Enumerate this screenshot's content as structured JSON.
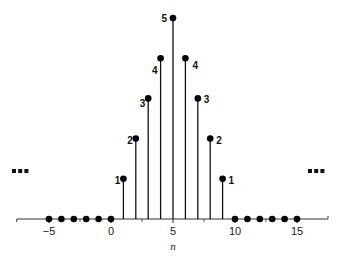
{
  "chart_data": {
    "type": "stem",
    "title": "",
    "xlabel": "n",
    "ylabel": "",
    "x": [
      -5,
      -4,
      -3,
      -2,
      -1,
      0,
      1,
      2,
      3,
      4,
      5,
      6,
      7,
      8,
      9,
      10,
      11,
      12,
      13,
      14,
      15
    ],
    "values": [
      0,
      0,
      0,
      0,
      0,
      0,
      1,
      2,
      3,
      4,
      5,
      4,
      3,
      2,
      1,
      0,
      0,
      0,
      0,
      0,
      0
    ],
    "xticks": [
      -5,
      0,
      5,
      10,
      15
    ],
    "xtick_labels": [
      "−5",
      "0",
      "5",
      "10",
      "15"
    ],
    "xlim": [
      -7.6,
      17.5
    ],
    "ylim": [
      0,
      5
    ],
    "grid": false,
    "legend": null,
    "annotations": [
      {
        "n": 1,
        "text": "1",
        "side": "left"
      },
      {
        "n": 2,
        "text": "2",
        "side": "left"
      },
      {
        "n": 3,
        "text": "3",
        "side": "left"
      },
      {
        "n": 4,
        "text": "4",
        "side": "left"
      },
      {
        "n": 5,
        "text": "5",
        "side": "left"
      },
      {
        "n": 6,
        "text": "4",
        "side": "right"
      },
      {
        "n": 7,
        "text": "3",
        "side": "right"
      },
      {
        "n": 8,
        "text": "2",
        "side": "right"
      },
      {
        "n": 9,
        "text": "1",
        "side": "right"
      }
    ],
    "continuation": {
      "left": "…",
      "right": "…"
    }
  },
  "colors": {
    "stem": "#111111",
    "marker": "#000000",
    "axis": "#333333"
  }
}
